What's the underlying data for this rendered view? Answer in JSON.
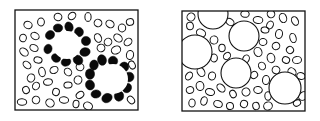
{
  "figure": {
    "width": 320,
    "height": 121,
    "stroke_color": "#111111",
    "fill_color": "#0a0a0a",
    "background": "#ffffff",
    "panels": [
      {
        "id": "left",
        "description": "Small particles with two large voids, each void ringed by filled (black) particles",
        "frame": {
          "x": 15,
          "y": 10,
          "w": 123,
          "h": 100
        },
        "large_circles": [
          {
            "cx": 67,
            "cy": 45,
            "r": 14
          },
          {
            "cx": 113,
            "cy": 79,
            "r": 15
          }
        ],
        "filled_ring_particles": [
          [
            50,
            35
          ],
          [
            58,
            28
          ],
          [
            69,
            27
          ],
          [
            79,
            32
          ],
          [
            86,
            41
          ],
          [
            85,
            52
          ],
          [
            78,
            60
          ],
          [
            66,
            62
          ],
          [
            56,
            58
          ],
          [
            48,
            49
          ],
          [
            94,
            65
          ],
          [
            102,
            60
          ],
          [
            113,
            61
          ],
          [
            124,
            67
          ],
          [
            129,
            77
          ],
          [
            127,
            88
          ],
          [
            119,
            96
          ],
          [
            107,
            98
          ],
          [
            96,
            94
          ],
          [
            90,
            85
          ],
          [
            90,
            74
          ]
        ],
        "open_particles": [
          [
            28,
            25
          ],
          [
            41,
            22
          ],
          [
            58,
            17
          ],
          [
            72,
            16
          ],
          [
            88,
            17
          ],
          [
            98,
            23
          ],
          [
            110,
            24
          ],
          [
            122,
            28
          ],
          [
            130,
            22
          ],
          [
            23,
            38
          ],
          [
            35,
            36
          ],
          [
            24,
            52
          ],
          [
            34,
            48
          ],
          [
            98,
            38
          ],
          [
            108,
            42
          ],
          [
            118,
            38
          ],
          [
            128,
            42
          ],
          [
            27,
            65
          ],
          [
            38,
            60
          ],
          [
            31,
            78
          ],
          [
            42,
            72
          ],
          [
            54,
            70
          ],
          [
            68,
            72
          ],
          [
            80,
            67
          ],
          [
            101,
            48
          ],
          [
            116,
            50
          ],
          [
            130,
            55
          ],
          [
            26,
            90
          ],
          [
            36,
            86
          ],
          [
            48,
            82
          ],
          [
            56,
            92
          ],
          [
            68,
            85
          ],
          [
            78,
            80
          ],
          [
            80,
            95
          ],
          [
            22,
            102
          ],
          [
            36,
            100
          ],
          [
            50,
            103
          ],
          [
            64,
            100
          ],
          [
            76,
            104
          ],
          [
            88,
            106
          ],
          [
            131,
            100
          ],
          [
            132,
            65
          ]
        ]
      },
      {
        "id": "right",
        "description": "Small particles with several large voids and no filled ring",
        "frame": {
          "x": 182,
          "y": 11,
          "w": 123,
          "h": 100
        },
        "large_circles": [
          {
            "cx": 213,
            "cy": 14,
            "r": 15
          },
          {
            "cx": 244,
            "cy": 36,
            "r": 15
          },
          {
            "cx": 195,
            "cy": 52,
            "r": 17
          },
          {
            "cx": 236,
            "cy": 73,
            "r": 15
          },
          {
            "cx": 285,
            "cy": 88,
            "r": 16
          }
        ],
        "open_particles": [
          [
            191,
            17
          ],
          [
            190,
            26
          ],
          [
            201,
            33
          ],
          [
            230,
            22
          ],
          [
            245,
            14
          ],
          [
            258,
            20
          ],
          [
            270,
            25
          ],
          [
            271,
            14
          ],
          [
            283,
            18
          ],
          [
            295,
            21
          ],
          [
            214,
            40
          ],
          [
            222,
            48
          ],
          [
            214,
            58
          ],
          [
            265,
            30
          ],
          [
            279,
            34
          ],
          [
            293,
            38
          ],
          [
            263,
            42
          ],
          [
            276,
            46
          ],
          [
            290,
            50
          ],
          [
            227,
            56
          ],
          [
            246,
            59
          ],
          [
            258,
            52
          ],
          [
            271,
            58
          ],
          [
            286,
            60
          ],
          [
            297,
            60
          ],
          [
            262,
            66
          ],
          [
            276,
            70
          ],
          [
            292,
            72
          ],
          [
            189,
            76
          ],
          [
            201,
            72
          ],
          [
            212,
            76
          ],
          [
            254,
            75
          ],
          [
            266,
            80
          ],
          [
            301,
            76
          ],
          [
            190,
            90
          ],
          [
            200,
            86
          ],
          [
            210,
            92
          ],
          [
            221,
            88
          ],
          [
            233,
            94
          ],
          [
            246,
            92
          ],
          [
            258,
            90
          ],
          [
            268,
            96
          ],
          [
            192,
            103
          ],
          [
            204,
            101
          ],
          [
            218,
            104
          ],
          [
            230,
            106
          ],
          [
            244,
            104
          ],
          [
            256,
            106
          ],
          [
            268,
            106
          ],
          [
            297,
            103
          ],
          [
            303,
            96
          ]
        ]
      }
    ]
  }
}
